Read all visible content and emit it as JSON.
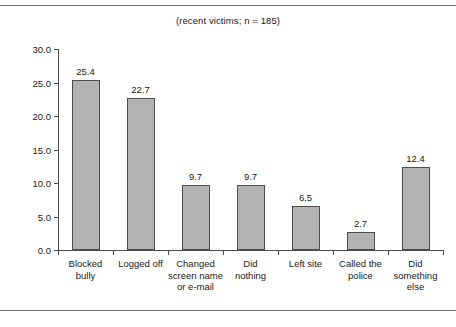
{
  "figure": {
    "subtitle": "(recent victims; n = 185)",
    "clipped_text_above": "l"
  },
  "chart_data": {
    "type": "bar",
    "title": "",
    "subtitle": "(recent victims; n = 185)",
    "xlabel": "",
    "ylabel": "",
    "ylim": [
      0.0,
      30.0
    ],
    "ytick_values": [
      0.0,
      5.0,
      10.0,
      15.0,
      20.0,
      25.0,
      30.0
    ],
    "ytick_labels": [
      "0.0",
      "5.0",
      "10.0",
      "15.0",
      "20.0",
      "25.0",
      "30.0"
    ],
    "grid": false,
    "legend": "none",
    "bar_color": "#b3b3b3",
    "bar_edge_color": "#4d4d4d",
    "categories": [
      "Blocked bully",
      "Logged off",
      "Changed screen name or e-mail",
      "Did nothing",
      "Left site",
      "Called the police",
      "Did something else"
    ],
    "category_label_lines": [
      [
        "Blocked",
        "bully"
      ],
      [
        "Logged off"
      ],
      [
        "Changed",
        "screen name",
        "or e-mail"
      ],
      [
        "Did",
        "nothing"
      ],
      [
        "Left site"
      ],
      [
        "Called the",
        "police"
      ],
      [
        "Did",
        "something",
        "else"
      ]
    ],
    "values": [
      25.4,
      22.7,
      9.7,
      9.7,
      6.5,
      2.7,
      12.4
    ],
    "value_labels": [
      "25.4",
      "22.7",
      "9.7",
      "9.7",
      "6.5",
      "2.7",
      "12.4"
    ]
  }
}
